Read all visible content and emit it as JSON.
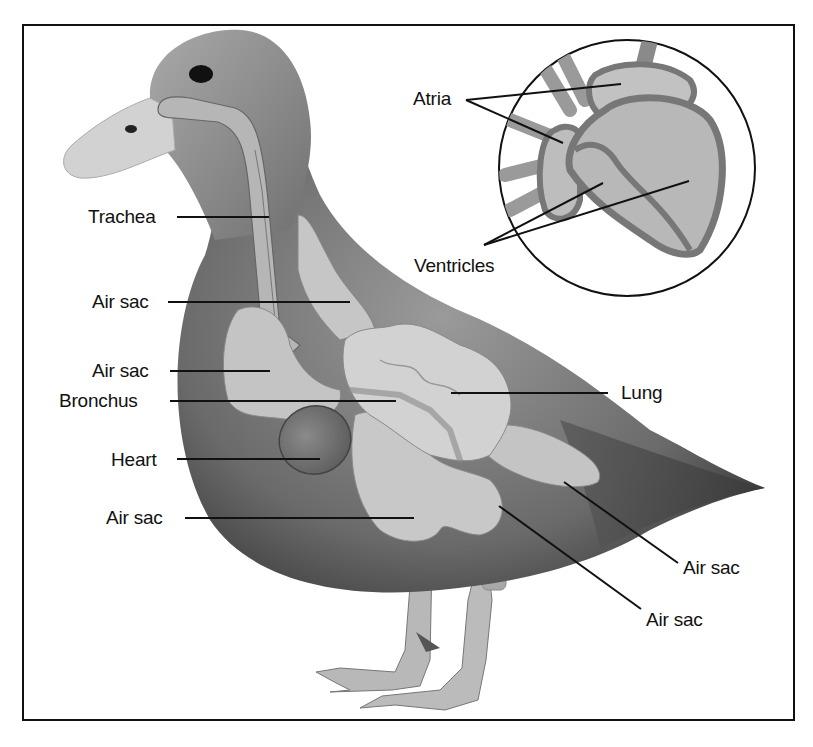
{
  "diagram": {
    "labels": {
      "trachea": "Trachea",
      "air_sac_neck": "Air sac",
      "air_sac_anterior": "Air sac",
      "bronchus": "Bronchus",
      "heart": "Heart",
      "air_sac_abdominal_left": "Air sac",
      "lung": "Lung",
      "air_sac_posterior": "Air sac",
      "air_sac_lower": "Air sac"
    },
    "inset": {
      "title": "Heart cross-section",
      "labels": {
        "atria": "Atria",
        "ventricles": "Ventricles"
      }
    },
    "colors": {
      "frame": "#111111",
      "body_dark": "#4a4a4a",
      "body_mid": "#7a7a7a",
      "organ_light": "#c8c8c8",
      "heart_organ": "#6e6e6e",
      "beak": "#d4d4d4",
      "leader_line": "#111111"
    }
  }
}
